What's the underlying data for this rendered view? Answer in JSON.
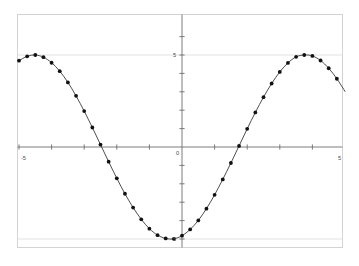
{
  "chart_data": {
    "type": "line",
    "title": "",
    "subtitle": "",
    "xlabel": "",
    "ylabel": "",
    "xlim": [
      -5.2,
      5.2
    ],
    "ylim": [
      -6.4,
      6.4
    ],
    "grid": true,
    "legend": null,
    "legend_position": "none",
    "x_ticks": [
      -5,
      -4,
      -3,
      -2,
      -1,
      0,
      1,
      2,
      3,
      4,
      5
    ],
    "y_ticks": [
      -6,
      -5,
      -4,
      -3,
      -2,
      -1,
      0,
      1,
      2,
      3,
      4,
      5,
      6
    ],
    "x_tick_labels": [
      "-5",
      "",
      "",
      "",
      "",
      "",
      "",
      "",
      "",
      "",
      "5"
    ],
    "y_tick_labels": [
      "",
      "-5",
      "",
      "",
      "",
      "",
      "0",
      "",
      "",
      "",
      "",
      "5",
      ""
    ],
    "gridlines_y": [
      5,
      -5
    ],
    "marker": "filled-circle",
    "marker_size": 1.9,
    "line_color": "#3a3a3a",
    "marker_color": "#111111",
    "axis_color": "#6e6e6e",
    "grid_color": "#e2e2e2",
    "frame_color": "#d3d3d3",
    "background_color": "#ffffff",
    "equation": "y = 5*sin(2*pi*x/5.9)",
    "amplitude": 5,
    "period": 5.9,
    "series": [
      {
        "name": "y = 5 sin(x)",
        "x": [
          -5.0,
          -4.75,
          -4.5,
          -4.25,
          -4.0,
          -3.75,
          -3.5,
          -3.25,
          -3.0,
          -2.75,
          -2.5,
          -2.25,
          -2.0,
          -1.75,
          -1.5,
          -1.25,
          -1.0,
          -0.75,
          -0.5,
          -0.25,
          0.0,
          0.25,
          0.5,
          0.75,
          1.0,
          1.25,
          1.5,
          1.75,
          2.0,
          2.25,
          2.5,
          2.75,
          3.0,
          3.25,
          3.5,
          3.75,
          4.0,
          4.25,
          4.5,
          4.75,
          5.0
        ],
        "y": [
          4.69,
          4.93,
          5.0,
          4.88,
          4.58,
          4.12,
          3.51,
          2.78,
          1.95,
          1.06,
          0.13,
          -0.8,
          -1.7,
          -2.54,
          -3.29,
          -3.93,
          -4.44,
          -4.79,
          -4.97,
          -4.99,
          -4.82,
          -4.48,
          -3.99,
          -3.35,
          -2.6,
          -1.76,
          -0.87,
          0.06,
          0.99,
          1.88,
          2.71,
          3.45,
          4.08,
          4.57,
          4.9,
          5.0,
          4.95,
          4.7,
          4.28,
          3.71,
          3.02
        ]
      }
    ]
  },
  "axes": {
    "x_axis_label_left": "-5",
    "x_axis_label_right": "5",
    "y_axis_label_top": "5",
    "y_axis_label_bottom": "-5",
    "origin_label": "0"
  }
}
